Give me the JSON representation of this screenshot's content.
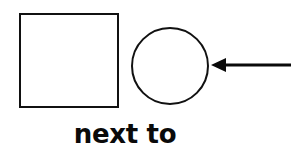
{
  "canvas": {
    "width": 298,
    "height": 149,
    "background_color": "#ffffff",
    "ink_color": "#111111"
  },
  "diagram": {
    "kind": "spatial-relation-illustration",
    "caption": "next to",
    "shapes": [
      {
        "id": "square",
        "name": "square-shape",
        "type": "rectangle",
        "x": 20,
        "y": 14,
        "width": 98,
        "height": 93,
        "stroke_color": "#111111",
        "stroke_width": 2,
        "fill": "none"
      },
      {
        "id": "circle",
        "name": "circle-shape",
        "type": "circle",
        "cx": 170,
        "cy": 66,
        "r": 38,
        "stroke_color": "#111111",
        "stroke_width": 2,
        "fill": "none"
      }
    ],
    "arrow": {
      "id": "arrow",
      "name": "left-pointing-arrow",
      "direction": "left",
      "tip_x": 211,
      "tip_y": 65,
      "tail_x": 291,
      "tail_y": 65,
      "head_length": 15,
      "head_half_height": 7,
      "shaft_thickness": 3,
      "color": "#0a0a0a",
      "points_at": "circle-shape"
    },
    "label": {
      "text": "next to",
      "center_x": 125,
      "baseline_y": 143,
      "font_size": 26,
      "font_weight": "bold",
      "color": "#0a0a0a"
    }
  }
}
